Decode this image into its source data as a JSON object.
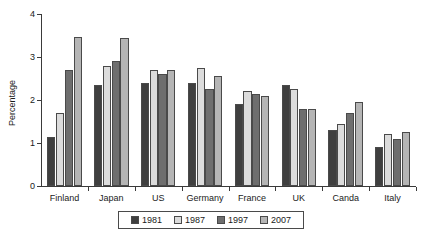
{
  "chart_data": {
    "type": "bar",
    "title": "",
    "xlabel": "",
    "ylabel": "Percentage",
    "ylim": [
      0,
      4
    ],
    "yticks": [
      0,
      1,
      2,
      3,
      4
    ],
    "ytick_labels": [
      "0",
      "1",
      "2",
      "3",
      "4"
    ],
    "grid": false,
    "legend_position": "bottom",
    "categories": [
      "Finland",
      "Japan",
      "US",
      "Germany",
      "France",
      "UK",
      "Canda",
      "Italy"
    ],
    "series": [
      {
        "name": "1981",
        "color": "#3f3f3f",
        "values": [
          1.15,
          2.35,
          2.4,
          2.4,
          1.9,
          2.35,
          1.3,
          0.9
        ]
      },
      {
        "name": "1987",
        "color": "#dcdcdc",
        "values": [
          1.7,
          2.8,
          2.7,
          2.75,
          2.2,
          2.25,
          1.45,
          1.2
        ]
      },
      {
        "name": "1997",
        "color": "#6e6e6e",
        "values": [
          2.7,
          2.9,
          2.6,
          2.25,
          2.15,
          1.8,
          1.7,
          1.1
        ]
      },
      {
        "name": "2007",
        "color": "#b5b5b5",
        "values": [
          3.47,
          3.45,
          2.7,
          2.55,
          2.1,
          1.8,
          1.95,
          1.25
        ]
      }
    ]
  }
}
